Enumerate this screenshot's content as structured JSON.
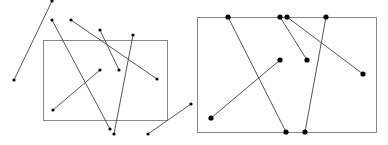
{
  "diagram": {
    "colors": {
      "line": "#555555",
      "rect": "#888888",
      "point": "#000000",
      "background": "#ffffff"
    },
    "before": {
      "clip_rect": {
        "x": 43,
        "y": 40,
        "w": 124,
        "h": 80
      },
      "segments": [
        {
          "x1": 52,
          "y1": 1,
          "x2": 14,
          "y2": 80
        },
        {
          "x1": 52,
          "y1": 20,
          "x2": 110,
          "y2": 129
        },
        {
          "x1": 71,
          "y1": 20,
          "x2": 157,
          "y2": 79
        },
        {
          "x1": 100,
          "y1": 30,
          "x2": 119,
          "y2": 70
        },
        {
          "x1": 133,
          "y1": 35,
          "x2": 114,
          "y2": 134
        },
        {
          "x1": 100,
          "y1": 70,
          "x2": 53,
          "y2": 110
        },
        {
          "x1": 191,
          "y1": 104,
          "x2": 148,
          "y2": 134
        }
      ]
    },
    "after": {
      "clip_rect": {
        "x": 197,
        "y": 17,
        "w": 179,
        "h": 115
      },
      "segments": [
        {
          "x1": 228,
          "y1": 17,
          "x2": 286,
          "y2": 132
        },
        {
          "x1": 280,
          "y1": 17,
          "x2": 307,
          "y2": 60
        },
        {
          "x1": 287,
          "y1": 17,
          "x2": 363,
          "y2": 74
        },
        {
          "x1": 326,
          "y1": 17,
          "x2": 305,
          "y2": 132
        },
        {
          "x1": 280,
          "y1": 60,
          "x2": 211,
          "y2": 118
        }
      ]
    }
  }
}
